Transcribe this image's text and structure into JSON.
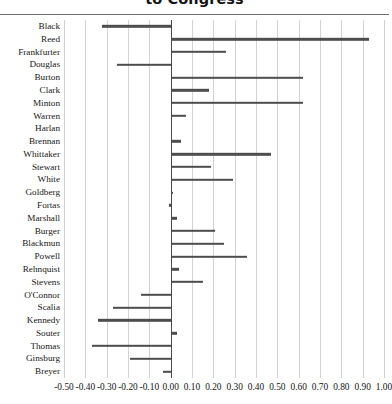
{
  "title": {
    "text": "to Congress"
  },
  "chart_data": {
    "type": "bar",
    "orientation": "horizontal",
    "title": "to Congress",
    "xlabel": "",
    "ylabel": "",
    "xlim": [
      -0.5,
      1.0
    ],
    "xtick_step": 0.1,
    "grid": true,
    "legend": false,
    "bar_color": "#4d4d4d",
    "grid_color": "#d3d3d3",
    "zero_line_color": "#4a4a4a",
    "xticks": [
      "-0.50",
      "-0.40",
      "-0.30",
      "-0.20",
      "-0.10",
      "0.00",
      "0.10",
      "0.20",
      "0.30",
      "0.40",
      "0.50",
      "0.60",
      "0.70",
      "0.80",
      "0.90",
      "1.00"
    ],
    "xtick_values": [
      -0.5,
      -0.4,
      -0.3,
      -0.2,
      -0.1,
      0.0,
      0.1,
      0.2,
      0.3,
      0.4,
      0.5,
      0.6,
      0.7,
      0.8,
      0.9,
      1.0
    ],
    "categories": [
      "Black",
      "Reed",
      "Frankfurter",
      "Douglas",
      "Burton",
      "Clark",
      "Minton",
      "Warren",
      "Harlan",
      "Brennan",
      "Whittaker",
      "Stewart",
      "White",
      "Goldberg",
      "Fortas",
      "Marshall",
      "Burger",
      "Blackmun",
      "Powell",
      "Rehnquist",
      "Stevens",
      "O'Connor",
      "Scalia",
      "Kennedy",
      "Souter",
      "Thomas",
      "Ginsburg",
      "Breyer"
    ],
    "values": [
      -0.32,
      0.93,
      0.26,
      -0.25,
      0.62,
      0.18,
      0.62,
      0.07,
      0.0,
      0.05,
      0.47,
      0.19,
      0.29,
      0.01,
      -0.01,
      0.03,
      0.21,
      0.25,
      0.36,
      0.04,
      0.15,
      -0.14,
      -0.27,
      -0.34,
      0.03,
      -0.37,
      -0.19,
      -0.035
    ]
  }
}
